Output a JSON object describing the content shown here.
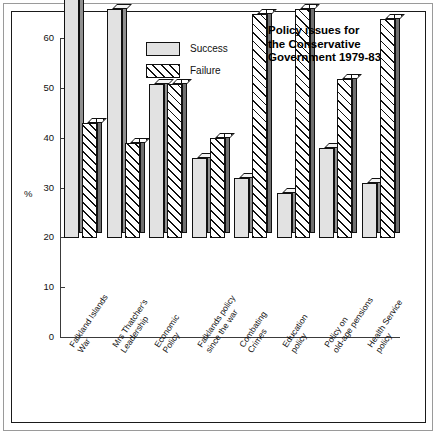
{
  "chart_data": {
    "type": "bar",
    "title_lines": [
      "Policy issues for",
      "the Conservative",
      "Government 1979-83"
    ],
    "xlabel": "",
    "ylabel": "%",
    "ylim": [
      0,
      60
    ],
    "yticks": [
      0,
      10,
      20,
      30,
      40,
      50,
      60
    ],
    "grid": false,
    "legend_position": "top-center",
    "categories": [
      "Falkland Islands War",
      "Mrs Thatcher's Leadership",
      "Economic Policy",
      "Falklands policy since the war",
      "Combating Crimes",
      "Education policy",
      "Policy on old-age pensions",
      "Health Service policy"
    ],
    "category_lines": [
      [
        "Falkland Islands",
        "War"
      ],
      [
        "Mrs Thatcher's",
        "Leadership"
      ],
      [
        "Economic",
        "Policy"
      ],
      [
        "Falklands policy",
        "since the war"
      ],
      [
        "Combating",
        "Crimes"
      ],
      [
        "Education",
        "policy"
      ],
      [
        "Policy on",
        "old-age pensions"
      ],
      [
        "Health Service",
        "policy"
      ]
    ],
    "series": [
      {
        "name": "Success",
        "values": [
          51,
          46,
          31,
          16,
          12,
          9,
          18,
          11
        ]
      },
      {
        "name": "Failure",
        "values": [
          23,
          19,
          31,
          20,
          45,
          46,
          32,
          44
        ]
      }
    ]
  },
  "legend": {
    "items": [
      {
        "label": "Success",
        "pattern": "light-stipple"
      },
      {
        "label": "Failure",
        "pattern": "diagonal-hatch"
      }
    ]
  },
  "axis": {
    "y_unit_label": "%",
    "tick_labels": [
      "60",
      "50",
      "40",
      "30",
      "20",
      "10",
      "0"
    ]
  }
}
